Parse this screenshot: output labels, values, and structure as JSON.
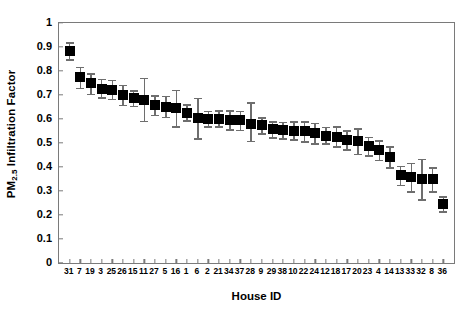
{
  "chart_data": {
    "type": "scatter",
    "title": "",
    "xlabel": "House ID",
    "ylabel": "PM2.5 Infiltration Factor",
    "ylabel_prefix": "PM",
    "ylabel_subscript": "2.5",
    "ylabel_suffix": " Infiltration Factor",
    "xlim": [
      0,
      37
    ],
    "ylim": [
      0,
      1
    ],
    "ytick_labels": [
      "0",
      "0.1",
      "0.2",
      "0.3",
      "0.4",
      "0.5",
      "0.6",
      "0.7",
      "0.8",
      "0.9",
      "1"
    ],
    "ytick_values": [
      0,
      0.1,
      0.2,
      0.3,
      0.4,
      0.5,
      0.6,
      0.7,
      0.8,
      0.9,
      1
    ],
    "grid": false,
    "legend": "none",
    "marker": "filled-square",
    "marker_color": "#000000",
    "errorbar_color": "#6e6e6e",
    "axis_color": "#7a7a7a",
    "categories": [
      "31",
      "7",
      "19",
      "3",
      "25",
      "26",
      "15",
      "11",
      "27",
      "5",
      "16",
      "1",
      "6",
      "2",
      "21",
      "34",
      "37",
      "28",
      "9",
      "29",
      "38",
      "10",
      "22",
      "24",
      "12",
      "18",
      "17",
      "20",
      "23",
      "4",
      "14",
      "13",
      "33",
      "32",
      "8",
      "36"
    ],
    "values": [
      0.885,
      0.775,
      0.748,
      0.727,
      0.722,
      0.7,
      0.688,
      0.68,
      0.658,
      0.652,
      0.645,
      0.627,
      0.603,
      0.602,
      0.602,
      0.597,
      0.596,
      0.58,
      0.573,
      0.557,
      0.553,
      0.552,
      0.548,
      0.54,
      0.531,
      0.527,
      0.513,
      0.508,
      0.487,
      0.472,
      0.443,
      0.365,
      0.358,
      0.35,
      0.35,
      0.245
    ],
    "err_low": [
      0.85,
      0.73,
      0.705,
      0.69,
      0.685,
      0.66,
      0.655,
      0.592,
      0.617,
      0.61,
      0.57,
      0.595,
      0.52,
      0.57,
      0.57,
      0.558,
      0.555,
      0.51,
      0.54,
      0.525,
      0.52,
      0.515,
      0.508,
      0.5,
      0.498,
      0.487,
      0.475,
      0.455,
      0.45,
      0.43,
      0.4,
      0.327,
      0.298,
      0.265,
      0.3,
      0.215
    ],
    "err_high": [
      0.92,
      0.818,
      0.79,
      0.768,
      0.763,
      0.742,
      0.72,
      0.772,
      0.7,
      0.697,
      0.722,
      0.662,
      0.688,
      0.635,
      0.637,
      0.637,
      0.635,
      0.67,
      0.608,
      0.59,
      0.588,
      0.59,
      0.59,
      0.585,
      0.567,
      0.57,
      0.553,
      0.562,
      0.527,
      0.512,
      0.487,
      0.405,
      0.418,
      0.435,
      0.4,
      0.278
    ]
  }
}
